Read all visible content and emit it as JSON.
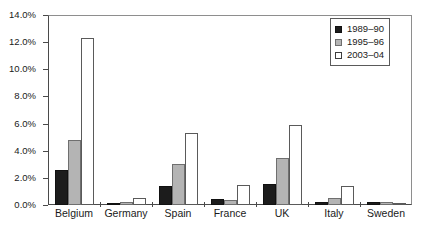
{
  "chart_data": {
    "type": "bar",
    "title": "",
    "subtitle": "",
    "xlabel": "",
    "ylabel": "",
    "categories": [
      "Belgium",
      "Germany",
      "Spain",
      "France",
      "UK",
      "Italy",
      "Sweden"
    ],
    "series": [
      {
        "name": "1989–90",
        "color": "#1c1c1c",
        "values": [
          2.6,
          0.05,
          1.4,
          0.45,
          1.55,
          0.2,
          0.2
        ]
      },
      {
        "name": "1995–96",
        "color": "#b4b4b4",
        "values": [
          4.8,
          0.2,
          3.0,
          0.4,
          3.45,
          0.5,
          0.25
        ]
      },
      {
        "name": "2003–04",
        "color": "#ffffff",
        "values": [
          12.3,
          0.55,
          5.3,
          1.5,
          5.9,
          1.4,
          0.02
        ]
      }
    ],
    "ylim": [
      0,
      14
    ],
    "ytick_step": 2,
    "ytick_labels": [
      "0.0%",
      "2.0%",
      "4.0%",
      "6.0%",
      "8.0%",
      "10.0%",
      "12.0%",
      "14.0%"
    ],
    "ytick_values": [
      0,
      2,
      4,
      6,
      8,
      10,
      12,
      14
    ],
    "grid": false,
    "legend_position": "top-right",
    "legend_entries": [
      "1989–90",
      "1995–96",
      "2003–04"
    ]
  }
}
